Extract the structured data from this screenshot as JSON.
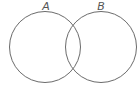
{
  "diagram": {
    "type": "venn",
    "sets": [
      {
        "label": "A",
        "cx": 45,
        "cy": 47,
        "r": 36
      },
      {
        "label": "B",
        "cx": 101,
        "cy": 47,
        "r": 36
      }
    ],
    "stroke_color": "#6b6b6b",
    "background": "#ffffff"
  }
}
